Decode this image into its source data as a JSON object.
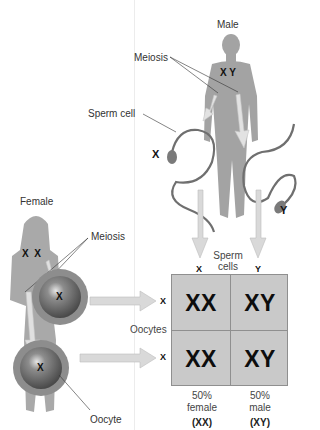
{
  "diagram": {
    "type": "sex-determination",
    "male": {
      "label": "Male",
      "chromosomes": "X Y",
      "meiosis_label": "Meiosis",
      "sperm_label": "Sperm cell",
      "sperm_x": "X",
      "sperm_y": "Y"
    },
    "female": {
      "label": "Female",
      "chromosomes": "X  X",
      "meiosis_label": "Meiosis",
      "oocyte1": "X",
      "oocyte2": "X",
      "oocyte_label": "Oocyte"
    },
    "punnett": {
      "column_header": "Sperm cells",
      "column_header_line1": "Sperm",
      "column_header_line2": "cells",
      "columns": [
        "X",
        "Y"
      ],
      "row_header": "Oocytes",
      "rows": [
        "X",
        "X"
      ],
      "cells": [
        [
          "XX",
          "XY"
        ],
        [
          "XX",
          "XY"
        ]
      ],
      "results": [
        {
          "percent": "50%",
          "sex": "female",
          "genotype": "(XX)"
        },
        {
          "percent": "50%",
          "sex": "male",
          "genotype": "(XY)"
        }
      ]
    },
    "colors": {
      "body": "#a3a3a3",
      "grid_fill": "#c9c9c9",
      "arrow": "#d4d4d4",
      "oocyte_outer": "#8a8a8a",
      "oocyte_inner": "#5e5e5e",
      "sperm": "#6f6f6f"
    }
  }
}
